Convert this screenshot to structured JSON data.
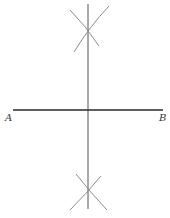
{
  "figure": {
    "points": {
      "A": {
        "label": "A"
      },
      "B": {
        "label": "B"
      }
    },
    "elements": [
      "segment-AB",
      "perpendicular-bisector",
      "upper-arc-pair",
      "lower-arc-pair"
    ]
  },
  "colors": {
    "segment": "#2a2a2a",
    "bisector": "#555555",
    "arcs": "#8c8c8c",
    "background": "#ffffff"
  }
}
